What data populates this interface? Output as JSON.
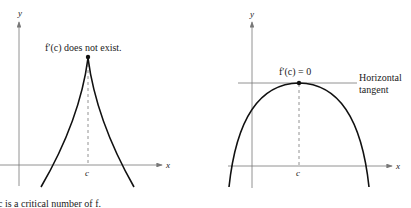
{
  "left_graph": {
    "y_label": "y",
    "x_label": "x",
    "c_label": "c",
    "annotation": "f′(c) does not exist."
  },
  "right_graph": {
    "y_label": "y",
    "x_label": "x",
    "c_label": "c",
    "annotation": "f′(c) = 0",
    "tangent_label_line1": "Horizontal",
    "tangent_label_line2": "tangent"
  },
  "caption": "c is a critical number of f."
}
